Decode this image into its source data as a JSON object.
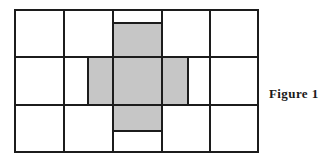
{
  "figure": {
    "caption": "Figure 1",
    "alt_description": "A 5 by 3 grid of rectangles with a shaded plus-shaped cross of five cells in the center",
    "colors": {
      "shade": "#c6c6c6",
      "line": "#1c1c1c",
      "cell": "#ffffff",
      "background": "#ffffff",
      "caption_color": "#1a1a1a"
    },
    "grid": {
      "columns": 5,
      "rows": 3,
      "x_lines": [
        15,
        64,
        113,
        162,
        210,
        258
      ],
      "y_lines": [
        10,
        57,
        105,
        152
      ],
      "stroke_width": 2
    },
    "shaded_cross": {
      "shape": "plus",
      "cell_count": 5,
      "center_cell": {
        "column": 3,
        "row": 2
      },
      "arms": [
        {
          "name": "top-arm",
          "x": 113,
          "y": 23,
          "width": 49,
          "height": 34
        },
        {
          "name": "left-arm",
          "x": 88,
          "y": 57,
          "width": 25,
          "height": 48
        },
        {
          "name": "center-cell",
          "x": 113,
          "y": 57,
          "width": 49,
          "height": 48
        },
        {
          "name": "right-arm",
          "x": 162,
          "y": 57,
          "width": 26,
          "height": 48
        },
        {
          "name": "bottom-arm",
          "x": 113,
          "y": 105,
          "width": 49,
          "height": 26
        }
      ]
    }
  }
}
